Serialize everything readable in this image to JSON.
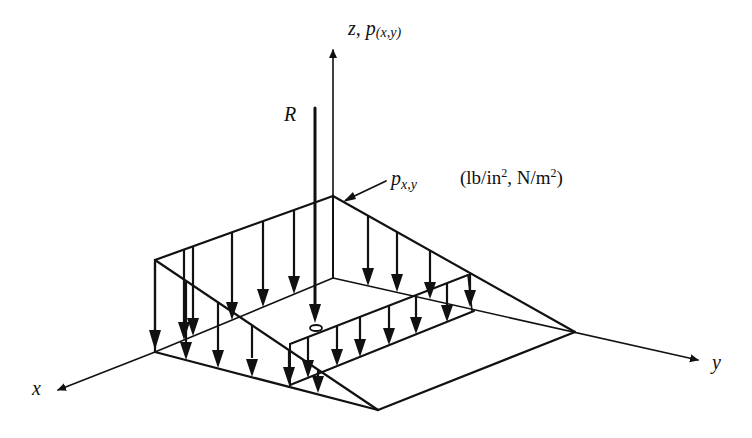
{
  "figure": {
    "type": "isometric load distribution diagram"
  },
  "labels": {
    "z_axis": {
      "main": "z, p",
      "subscript": "(x,y)"
    },
    "resultant": "R",
    "pressure": {
      "main": "p",
      "subscript": "x,y"
    },
    "units": {
      "open": "(lb/in",
      "exp1": "2",
      "middle": ", N/m",
      "exp2": "2",
      "close": ")"
    },
    "x_axis": "x",
    "y_axis": "y"
  },
  "colors": {
    "ink": "#111111",
    "background": "#ffffff"
  },
  "geometry": {
    "axes": {
      "origin": [
        333,
        278
      ],
      "z_end": [
        333,
        48
      ],
      "x_start": [
        155,
        352
      ],
      "x_end": [
        55,
        392
      ],
      "y_end": [
        700,
        361
      ]
    },
    "resultant_line": {
      "x": 315,
      "y_top": 108,
      "y_bottom": 326,
      "ring_y": 328
    },
    "pressure_leader": {
      "from": [
        388,
        180
      ],
      "to": [
        342,
        201
      ]
    }
  }
}
